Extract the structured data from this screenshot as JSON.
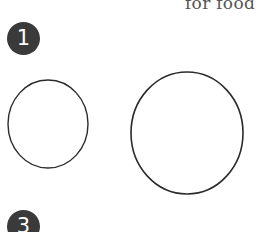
{
  "heading": {
    "text_fragment": "for food"
  },
  "steps": [
    {
      "number": "1"
    },
    {
      "number": "3"
    }
  ],
  "drawing": {
    "shapes": [
      {
        "kind": "circle-sketch",
        "label": "small-circle"
      },
      {
        "kind": "circle-sketch",
        "label": "large-circle"
      }
    ],
    "stroke_color": "#2b2b2b"
  },
  "colors": {
    "badge_fill": "#3a3a3a",
    "badge_text": "#ffffff",
    "heading_text": "#555555",
    "background": "#ffffff"
  }
}
